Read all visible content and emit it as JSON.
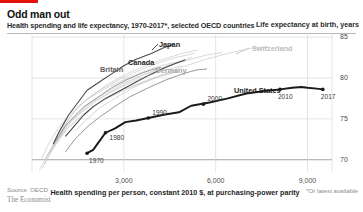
{
  "header": {
    "title": "Odd man out",
    "subtitle": "Health spending and life expectancy, 1970-2017*, selected OECD countries",
    "right_axis_title": "Life expectancy at birth, years"
  },
  "footer": {
    "source": "Source: OECD",
    "brand": "The Economist",
    "footnote": "*Or latest available",
    "x_axis_caption": "Health spending per person, constant 2010 $, at purchasing-power parity"
  },
  "colors": {
    "brand_red": "#e3120b",
    "highlight": "#1a1a1a",
    "dark_gray": "#4a4a4a",
    "mid_gray": "#8c8c8c",
    "light_gray": "#c9c9c9",
    "grid": "#d8d8d8"
  },
  "chart_data": {
    "type": "line",
    "title": "Odd man out",
    "subtitle": "Health spending and life expectancy, 1970-2017*, selected OECD countries",
    "xlabel": "Health spending per person, constant 2010 $, at purchasing-power parity",
    "ylabel": "Life expectancy at birth, years",
    "xlim": [
      0,
      9800
    ],
    "ylim": [
      68.5,
      85.5
    ],
    "xticks": [
      3000,
      6000,
      9000
    ],
    "xticklabels": [
      "3,000",
      "6,000",
      "9,000"
    ],
    "yticks": [
      70,
      75,
      80,
      85
    ],
    "yticklabels": [
      "70",
      "75",
      "80",
      "85"
    ],
    "grid": true,
    "legend": "inline-labels",
    "year_markers": [
      "1970",
      "1980",
      "1990",
      "2000",
      "2010",
      "2017"
    ],
    "series": [
      {
        "name": "United States",
        "emphasis": "highlight",
        "labelled": true,
        "points": [
          [
            1800,
            70.8
          ],
          [
            2000,
            71.2
          ],
          [
            2150,
            72.0
          ],
          [
            2400,
            73.3
          ],
          [
            2700,
            73.8
          ],
          [
            3050,
            74.6
          ],
          [
            3400,
            74.8
          ],
          [
            3800,
            75.1
          ],
          [
            4300,
            75.5
          ],
          [
            4800,
            75.8
          ],
          [
            5200,
            76.6
          ],
          [
            5800,
            77.0
          ],
          [
            6400,
            77.5
          ],
          [
            7000,
            78.1
          ],
          [
            7600,
            78.4
          ],
          [
            8100,
            78.6
          ],
          [
            8500,
            78.8
          ],
          [
            8800,
            78.9
          ],
          [
            9000,
            78.8
          ],
          [
            9300,
            78.7
          ],
          [
            9500,
            78.6
          ]
        ],
        "markers": [
          {
            "year": "1970",
            "x": 1800,
            "y": 70.8
          },
          {
            "year": "1980",
            "x": 2400,
            "y": 73.3
          },
          {
            "year": "1990",
            "x": 3800,
            "y": 75.1
          },
          {
            "year": "2000",
            "x": 5600,
            "y": 76.8
          },
          {
            "year": "2010",
            "x": 8100,
            "y": 78.6
          },
          {
            "year": "2017",
            "x": 9500,
            "y": 78.6
          }
        ]
      },
      {
        "name": "Japan",
        "emphasis": "dark",
        "labelled": true,
        "points": [
          [
            700,
            72.0
          ],
          [
            900,
            73.5
          ],
          [
            1200,
            75.5
          ],
          [
            1500,
            77.0
          ],
          [
            1800,
            78.5
          ],
          [
            2200,
            79.5
          ],
          [
            2600,
            80.5
          ],
          [
            3000,
            81.5
          ],
          [
            3400,
            82.3
          ],
          [
            3900,
            83.0
          ],
          [
            4300,
            83.7
          ],
          [
            4600,
            84.1
          ]
        ]
      },
      {
        "name": "Canada",
        "emphasis": "dark",
        "labelled": true,
        "points": [
          [
            1100,
            72.9
          ],
          [
            1400,
            74.2
          ],
          [
            1700,
            75.5
          ],
          [
            2000,
            76.5
          ],
          [
            2400,
            77.5
          ],
          [
            2900,
            78.5
          ],
          [
            3400,
            79.5
          ],
          [
            3900,
            80.5
          ],
          [
            4300,
            81.2
          ],
          [
            4700,
            81.8
          ],
          [
            5000,
            82.2
          ]
        ]
      },
      {
        "name": "Britain",
        "emphasis": "mid",
        "labelled": true,
        "points": [
          [
            700,
            71.9
          ],
          [
            900,
            73.0
          ],
          [
            1100,
            74.2
          ],
          [
            1400,
            75.4
          ],
          [
            1700,
            76.5
          ],
          [
            2100,
            77.5
          ],
          [
            2600,
            78.8
          ],
          [
            3100,
            79.8
          ],
          [
            3600,
            80.6
          ],
          [
            3900,
            81.0
          ],
          [
            4200,
            81.3
          ]
        ]
      },
      {
        "name": "Germany",
        "emphasis": "mid",
        "labelled": true,
        "points": [
          [
            1100,
            71.0
          ],
          [
            1400,
            72.5
          ],
          [
            1800,
            74.0
          ],
          [
            2200,
            75.2
          ],
          [
            2700,
            76.5
          ],
          [
            3200,
            77.7
          ],
          [
            3800,
            78.8
          ],
          [
            4400,
            79.8
          ],
          [
            5000,
            80.6
          ],
          [
            5400,
            81.0
          ],
          [
            5700,
            81.1
          ]
        ]
      },
      {
        "name": "Switzerland",
        "emphasis": "light",
        "labelled": true,
        "points": [
          [
            1400,
            73.5
          ],
          [
            1800,
            75.0
          ],
          [
            2200,
            76.3
          ],
          [
            2700,
            77.5
          ],
          [
            3300,
            78.8
          ],
          [
            4000,
            80.0
          ],
          [
            4800,
            81.2
          ],
          [
            5600,
            82.2
          ],
          [
            6400,
            83.0
          ],
          [
            7100,
            83.6
          ],
          [
            7700,
            83.8
          ]
        ]
      },
      {
        "name": "other-1",
        "emphasis": "light",
        "labelled": false,
        "points": [
          [
            500,
            70.5
          ],
          [
            800,
            72.5
          ],
          [
            1100,
            74.0
          ],
          [
            1500,
            75.5
          ],
          [
            1900,
            76.8
          ],
          [
            2400,
            78.0
          ],
          [
            3000,
            79.2
          ],
          [
            3600,
            80.3
          ],
          [
            4200,
            81.2
          ],
          [
            4800,
            82.0
          ],
          [
            5200,
            82.5
          ]
        ]
      },
      {
        "name": "other-2",
        "emphasis": "light",
        "labelled": false,
        "points": [
          [
            400,
            69.5
          ],
          [
            700,
            71.5
          ],
          [
            1000,
            73.3
          ],
          [
            1300,
            74.8
          ],
          [
            1700,
            76.0
          ],
          [
            2100,
            77.2
          ],
          [
            2600,
            78.3
          ],
          [
            3200,
            79.4
          ],
          [
            3800,
            80.3
          ],
          [
            4400,
            81.0
          ],
          [
            4900,
            81.5
          ]
        ]
      },
      {
        "name": "other-3",
        "emphasis": "light",
        "labelled": false,
        "points": [
          [
            600,
            71.0
          ],
          [
            900,
            73.0
          ],
          [
            1200,
            75.0
          ],
          [
            1600,
            76.8
          ],
          [
            2000,
            78.0
          ],
          [
            2500,
            79.3
          ],
          [
            3100,
            80.5
          ],
          [
            3700,
            81.5
          ],
          [
            4300,
            82.3
          ],
          [
            4900,
            83.0
          ],
          [
            5400,
            83.4
          ]
        ]
      },
      {
        "name": "other-4",
        "emphasis": "light",
        "labelled": false,
        "points": [
          [
            350,
            69.0
          ],
          [
            600,
            70.8
          ],
          [
            900,
            72.5
          ],
          [
            1200,
            74.0
          ],
          [
            1600,
            75.3
          ],
          [
            2000,
            76.5
          ],
          [
            2500,
            77.6
          ],
          [
            3000,
            78.6
          ],
          [
            3600,
            79.5
          ],
          [
            4200,
            80.3
          ],
          [
            4700,
            80.8
          ]
        ]
      },
      {
        "name": "other-5",
        "emphasis": "light",
        "labelled": false,
        "points": [
          [
            800,
            72.3
          ],
          [
            1100,
            74.0
          ],
          [
            1500,
            75.6
          ],
          [
            1900,
            77.0
          ],
          [
            2400,
            78.2
          ],
          [
            3000,
            79.4
          ],
          [
            3700,
            80.5
          ],
          [
            4400,
            81.4
          ],
          [
            5100,
            82.2
          ],
          [
            5700,
            82.8
          ],
          [
            6200,
            83.1
          ]
        ]
      },
      {
        "name": "other-6",
        "emphasis": "light",
        "labelled": false,
        "points": [
          [
            300,
            70.0
          ],
          [
            550,
            72.0
          ],
          [
            850,
            73.8
          ],
          [
            1150,
            75.2
          ],
          [
            1500,
            76.5
          ],
          [
            1900,
            77.6
          ],
          [
            2400,
            78.7
          ],
          [
            3000,
            79.8
          ],
          [
            3600,
            80.7
          ],
          [
            4200,
            81.5
          ],
          [
            4800,
            82.0
          ]
        ]
      },
      {
        "name": "other-7",
        "emphasis": "light",
        "labelled": false,
        "points": [
          [
            450,
            70.2
          ],
          [
            750,
            72.2
          ],
          [
            1050,
            74.2
          ],
          [
            1400,
            76.0
          ],
          [
            1800,
            77.4
          ],
          [
            2300,
            78.7
          ],
          [
            2900,
            79.9
          ],
          [
            3500,
            80.9
          ],
          [
            4100,
            81.8
          ],
          [
            4700,
            82.5
          ],
          [
            5300,
            83.0
          ]
        ]
      },
      {
        "name": "other-8",
        "emphasis": "light",
        "labelled": false,
        "points": [
          [
            250,
            68.8
          ],
          [
            500,
            70.5
          ],
          [
            800,
            72.2
          ],
          [
            1100,
            73.6
          ],
          [
            1500,
            75.0
          ],
          [
            1900,
            76.2
          ],
          [
            2400,
            77.4
          ],
          [
            3000,
            78.5
          ],
          [
            3600,
            79.4
          ],
          [
            4200,
            80.2
          ],
          [
            4800,
            80.8
          ]
        ]
      }
    ]
  }
}
